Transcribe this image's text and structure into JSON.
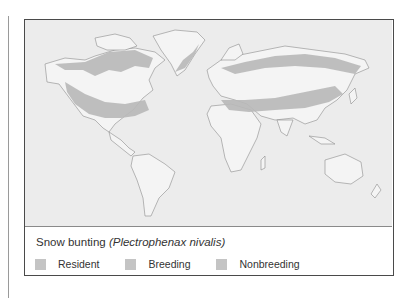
{
  "map": {
    "title_common": "Snow bunting",
    "title_scientific": "(Plectrophenax nivalis)",
    "colors": {
      "ocean": "#ececec",
      "land": "#f4f4f4",
      "coast": "#8c8c8c",
      "range": "#b9b9b9"
    }
  },
  "legend": {
    "items": [
      {
        "label": "Resident",
        "color": "#c4c4c4"
      },
      {
        "label": "Breeding",
        "color": "#c4c4c4"
      },
      {
        "label": "Nonbreeding",
        "color": "#c4c4c4"
      }
    ]
  }
}
